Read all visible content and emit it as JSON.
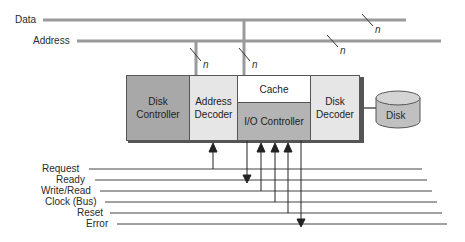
{
  "buses": {
    "data_label": "Data",
    "address_label": "Address",
    "width_label": "n"
  },
  "blocks": {
    "disk_controller": "Disk Controller",
    "address_decoder": "Address Decoder",
    "cache": "Cache",
    "io_controller": "I/O Controller",
    "disk_decoder": "Disk Decoder",
    "disk": "Disk"
  },
  "signals": [
    {
      "label": "Request"
    },
    {
      "label": "Ready"
    },
    {
      "label": "Write/Read"
    },
    {
      "label": "Clock (Bus)"
    },
    {
      "label": "Reset"
    },
    {
      "label": "Error"
    }
  ],
  "colors": {
    "bus": "#9a9a9a",
    "disk_controller": "#a8a8a8",
    "address_decoder": "#e6e6e6",
    "cache": "#ffffff",
    "io_controller": "#b4b4b4",
    "disk_decoder": "#e6e6e6",
    "disk": "#c0c0c0"
  }
}
